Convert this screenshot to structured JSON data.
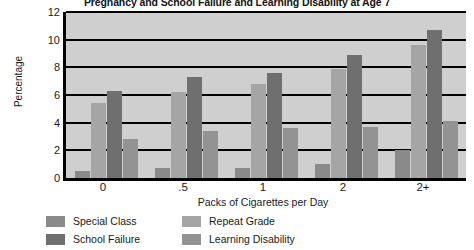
{
  "chart_data": {
    "type": "bar",
    "title": "Pregnancy and School Failure and Learning Disability at Age 7",
    "xlabel": "Packs of Cigarettes per Day",
    "ylabel": "Percentage",
    "categories": [
      "0",
      ".5",
      "1",
      "2",
      "2+"
    ],
    "series": [
      {
        "name": "Special Class",
        "color": "#8a8a8a",
        "values": [
          0.5,
          0.7,
          0.7,
          1.0,
          2.0
        ]
      },
      {
        "name": "Repeat Grade",
        "color": "#a5a5a5",
        "values": [
          5.4,
          6.2,
          6.8,
          7.9,
          9.6
        ]
      },
      {
        "name": "School Failure",
        "color": "#6f6f6f",
        "values": [
          6.3,
          7.3,
          7.6,
          8.9,
          10.7
        ]
      },
      {
        "name": "Learning Disability",
        "color": "#939393",
        "values": [
          2.8,
          3.4,
          3.6,
          3.7,
          4.1
        ]
      }
    ],
    "ylim": [
      0,
      12
    ],
    "yticks": [
      0,
      2,
      4,
      6,
      8,
      10,
      12
    ],
    "ytick_labels": [
      "0",
      "2",
      "4",
      "6",
      "8",
      "10",
      "12"
    ],
    "grid": true,
    "grid_axis": "y",
    "legend_position": "below",
    "plot_background": "#cfcfcf",
    "axis_color": "#000000",
    "legend_order": [
      "Special Class",
      "Repeat Grade",
      "School Failure",
      "Learning Disability"
    ]
  }
}
